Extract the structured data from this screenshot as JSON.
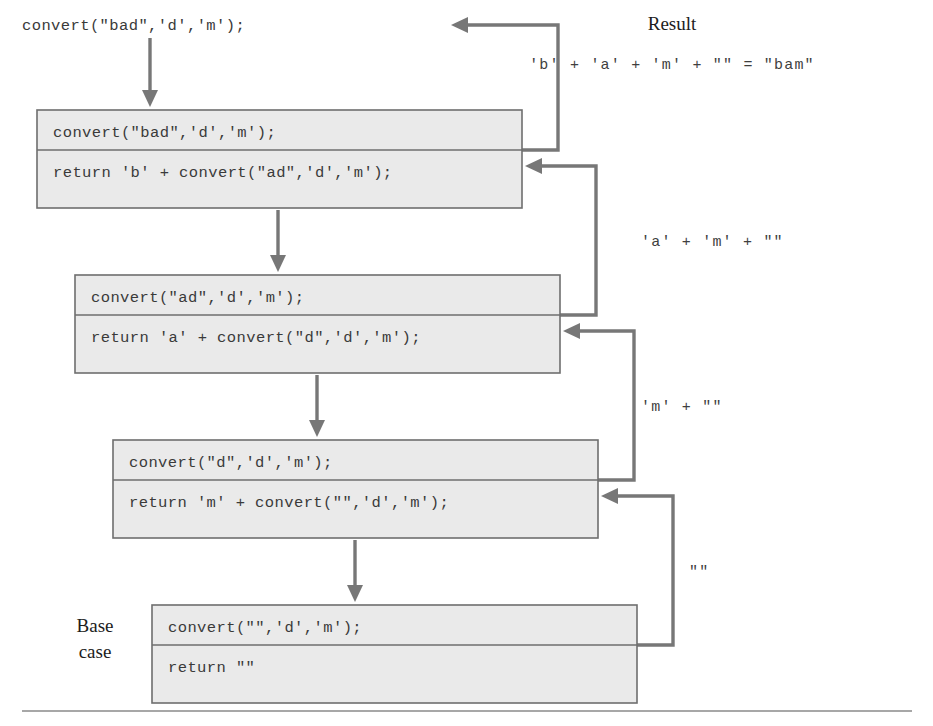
{
  "figure": {
    "title_text": "convert(\"bad\",'d','m');",
    "result_heading": "Result",
    "result_expression": "'b' + 'a' + 'm' + \"\" = \"bam\"",
    "base_case_line1": "Base",
    "base_case_line2": "case",
    "colors": {
      "frame_fill": "#eaeaea",
      "frame_stroke": "#6e6e6e",
      "arrow": "#777777",
      "code_text": "#3a3a3a",
      "label_text": "#1c1c1c",
      "background": "#ffffff"
    }
  },
  "frames": [
    {
      "id": "frame-1",
      "call": "convert(\"bad\",'d','m');",
      "return": "return 'b' + convert(\"ad\",'d','m');",
      "x": 37,
      "y": 110,
      "w": 485,
      "h": 98,
      "divider_dy": 40
    },
    {
      "id": "frame-2",
      "call": "convert(\"ad\",'d','m');",
      "return": "return 'a' + convert(\"d\",'d','m');",
      "x": 75,
      "y": 275,
      "w": 485,
      "h": 98,
      "divider_dy": 40
    },
    {
      "id": "frame-3",
      "call": "convert(\"d\",'d','m');",
      "return": "return 'm' + convert(\"\",'d','m');",
      "x": 113,
      "y": 440,
      "w": 485,
      "h": 98,
      "divider_dy": 40
    },
    {
      "id": "frame-4",
      "call": "convert(\"\",'d','m');",
      "return": "return \"\"",
      "x": 152,
      "y": 605,
      "w": 485,
      "h": 98,
      "divider_dy": 40
    }
  ],
  "return_labels": [
    {
      "id": "return-label-1",
      "text": "'a' + 'm' + \"\"",
      "x": 641,
      "y": 240
    },
    {
      "id": "return-label-2",
      "text": "'m' + \"\"",
      "x": 641,
      "y": 405
    },
    {
      "id": "return-label-3",
      "text": "\"\"",
      "x": 689,
      "y": 570
    }
  ],
  "call_arrows": [
    {
      "id": "call-arrow-initial",
      "x": 150,
      "y1": 38,
      "y2": 104
    },
    {
      "id": "call-arrow-1-2",
      "x": 278,
      "y1": 210,
      "y2": 269
    },
    {
      "id": "call-arrow-2-3",
      "x": 317,
      "y1": 375,
      "y2": 434
    },
    {
      "id": "call-arrow-3-4",
      "x": 355,
      "y1": 540,
      "y2": 599
    }
  ],
  "return_arrows": [
    {
      "id": "return-arrow-top",
      "from_x": 522,
      "from_y": 150,
      "turn_x": 558,
      "to_y": 25,
      "head_x": 453
    },
    {
      "id": "return-arrow-2-1",
      "from_x": 560,
      "from_y": 315,
      "turn_x": 596,
      "to_y": 166,
      "head_x": 527
    },
    {
      "id": "return-arrow-3-2",
      "from_x": 598,
      "from_y": 480,
      "turn_x": 634,
      "to_y": 331,
      "head_x": 565
    },
    {
      "id": "return-arrow-4-3",
      "from_x": 637,
      "from_y": 645,
      "turn_x": 673,
      "to_y": 496,
      "head_x": 603
    }
  ],
  "baseline_rule": {
    "id": "bottom-rule",
    "x1": 22,
    "x2": 912,
    "y": 711
  }
}
